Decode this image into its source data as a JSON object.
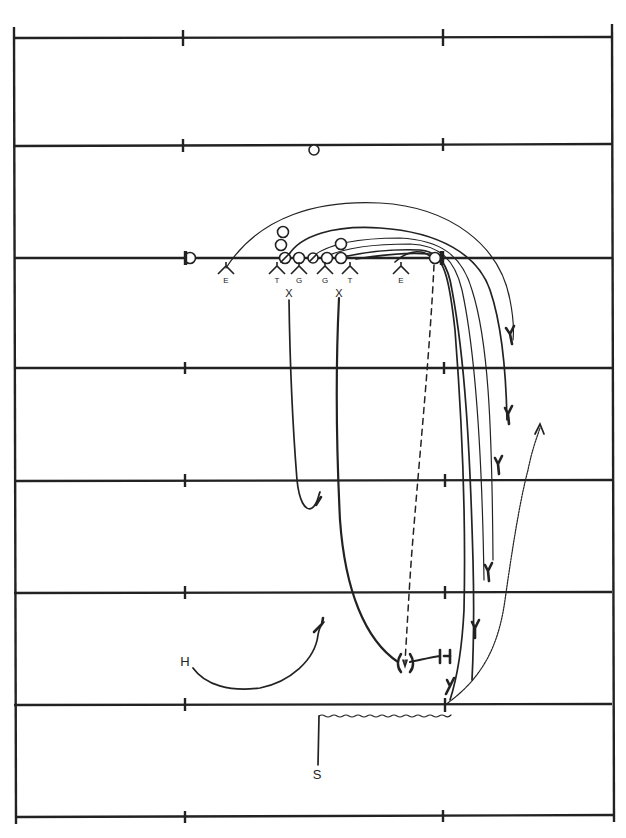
{
  "diagram": {
    "type": "football-play-diagram",
    "field": {
      "sidelines_x": [
        13,
        612
      ],
      "hash_marks_x": [
        183,
        443
      ],
      "yard_lines_y": [
        33,
        146,
        258,
        368,
        481,
        593,
        705,
        817
      ],
      "line_of_scrimmage_y": 258
    },
    "offense": {
      "symbol": "circle",
      "players": [
        {
          "id": "split-end-left",
          "x": 190,
          "y": 258
        },
        {
          "id": "wingback",
          "x": 283,
          "y": 232
        },
        {
          "id": "back-2",
          "x": 281,
          "y": 245
        },
        {
          "id": "tackle-left",
          "x": 285,
          "y": 258,
          "marked": "slash"
        },
        {
          "id": "guard-left",
          "x": 299,
          "y": 258
        },
        {
          "id": "center",
          "x": 313,
          "y": 258,
          "marked": "slash"
        },
        {
          "id": "guard-right",
          "x": 327,
          "y": 258
        },
        {
          "id": "tackle-right",
          "x": 341,
          "y": 258
        },
        {
          "id": "tight-back",
          "x": 341,
          "y": 244
        },
        {
          "id": "end-right",
          "x": 435,
          "y": 258
        },
        {
          "id": "deep-back",
          "x": 314,
          "y": 150
        }
      ]
    },
    "defense": {
      "linemen": [
        {
          "label": "E",
          "x": 226,
          "y": 272
        },
        {
          "label": "T",
          "x": 277,
          "y": 272
        },
        {
          "label": "G",
          "x": 299,
          "y": 272
        },
        {
          "label": "G",
          "x": 325,
          "y": 272
        },
        {
          "label": "T",
          "x": 350,
          "y": 272
        },
        {
          "label": "E",
          "x": 401,
          "y": 272
        }
      ],
      "linebackers": [
        {
          "label": "X",
          "x": 289,
          "y": 292
        },
        {
          "label": "X",
          "x": 339,
          "y": 292
        }
      ],
      "deep": [
        {
          "label": "H",
          "x": 185,
          "y": 661
        },
        {
          "label": "S",
          "x": 317,
          "y": 773
        }
      ]
    },
    "labels": {
      "E": "E",
      "T": "T",
      "G": "G",
      "X": "X",
      "H": "H",
      "S": "S"
    }
  }
}
